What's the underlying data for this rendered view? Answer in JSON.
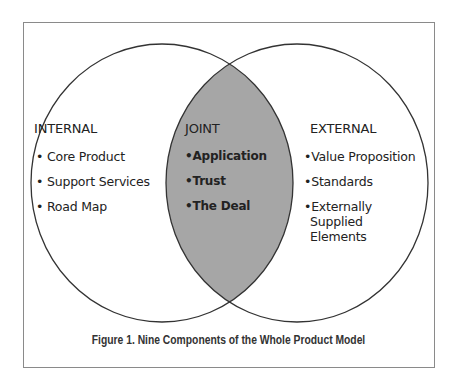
{
  "figure": {
    "caption": "Figure 1. Nine Components of the Whole Product Model",
    "colors": {
      "overlap_fill": "#a6a6a6",
      "stroke": "#333333",
      "frame": "#8a8a8a"
    }
  },
  "internal": {
    "title": "INTERNAL",
    "items": [
      "• Core Product",
      "• Support Services",
      "• Road Map"
    ]
  },
  "joint": {
    "title": "JOINT",
    "items": [
      "•Application",
      "•Trust",
      "•The Deal"
    ]
  },
  "external": {
    "title": "EXTERNAL",
    "items": [
      "•Value Proposition",
      "•Standards",
      "•Externally",
      "Supplied",
      "Elements"
    ]
  }
}
